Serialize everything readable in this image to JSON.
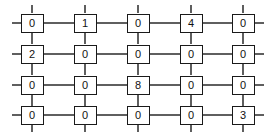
{
  "diagram": {
    "type": "grid-network",
    "rows": 4,
    "columns": 5,
    "colors": {
      "line": "#1a1a1a",
      "node_border": "#1a1a1a",
      "node_fill": "#ffffff",
      "text": "#111111",
      "background": "#ffffff"
    },
    "geometry": {
      "column_centers": [
        32,
        85,
        138,
        191,
        243
      ],
      "row_centers": [
        23,
        54,
        85,
        115
      ],
      "node_width": 23,
      "node_height": 19,
      "stub_length": 10
    },
    "grid_values": [
      [
        "0",
        "1",
        "0",
        "4",
        "0"
      ],
      [
        "2",
        "0",
        "0",
        "0",
        "0"
      ],
      [
        "0",
        "0",
        "8",
        "0",
        "0"
      ],
      [
        "0",
        "0",
        "0",
        "0",
        "3"
      ]
    ],
    "nodes": [
      {
        "id": "r1c1",
        "row": 0,
        "col": 0,
        "value": "0"
      },
      {
        "id": "r1c2",
        "row": 0,
        "col": 1,
        "value": "1"
      },
      {
        "id": "r1c3",
        "row": 0,
        "col": 2,
        "value": "0"
      },
      {
        "id": "r1c4",
        "row": 0,
        "col": 3,
        "value": "4"
      },
      {
        "id": "r1c5",
        "row": 0,
        "col": 4,
        "value": "0"
      },
      {
        "id": "r2c1",
        "row": 1,
        "col": 0,
        "value": "2"
      },
      {
        "id": "r2c2",
        "row": 1,
        "col": 1,
        "value": "0"
      },
      {
        "id": "r2c3",
        "row": 1,
        "col": 2,
        "value": "0"
      },
      {
        "id": "r2c4",
        "row": 1,
        "col": 3,
        "value": "0"
      },
      {
        "id": "r2c5",
        "row": 1,
        "col": 4,
        "value": "0"
      },
      {
        "id": "r3c1",
        "row": 2,
        "col": 0,
        "value": "0"
      },
      {
        "id": "r3c2",
        "row": 2,
        "col": 1,
        "value": "0"
      },
      {
        "id": "r3c3",
        "row": 2,
        "col": 2,
        "value": "8"
      },
      {
        "id": "r3c4",
        "row": 2,
        "col": 3,
        "value": "0"
      },
      {
        "id": "r3c5",
        "row": 2,
        "col": 4,
        "value": "0"
      },
      {
        "id": "r4c1",
        "row": 3,
        "col": 0,
        "value": "0"
      },
      {
        "id": "r4c2",
        "row": 3,
        "col": 1,
        "value": "0"
      },
      {
        "id": "r4c3",
        "row": 3,
        "col": 2,
        "value": "0"
      },
      {
        "id": "r4c4",
        "row": 3,
        "col": 3,
        "value": "0"
      },
      {
        "id": "r4c5",
        "row": 3,
        "col": 4,
        "value": "0"
      }
    ]
  }
}
